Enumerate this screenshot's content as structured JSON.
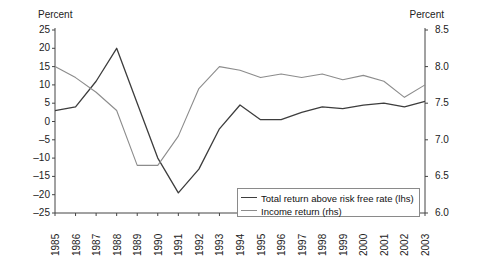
{
  "chart_data": {
    "type": "line",
    "title": "",
    "xlabel": "",
    "ylabel": "Percent",
    "left_axis": {
      "label": "Percent",
      "ticks": [
        "25",
        "20",
        "15",
        "10",
        "5",
        "0",
        "-5",
        "-10",
        "-15",
        "-20",
        "-25"
      ],
      "ylim": [
        -25,
        25
      ],
      "step": 5
    },
    "right_axis": {
      "label": "Percent",
      "ticks": [
        "8.5",
        "8.0",
        "7.5",
        "7.0",
        "6.5",
        "6.0"
      ],
      "ylim": [
        6.0,
        8.5
      ],
      "step": 0.5
    },
    "categories": [
      "1985",
      "1986",
      "1987",
      "1988",
      "1989",
      "1990",
      "1991",
      "1992",
      "1993",
      "1994",
      "1995",
      "1996",
      "1997",
      "1998",
      "1999",
      "2000",
      "2001",
      "2002",
      "2003"
    ],
    "x": [
      1985,
      1986,
      1987,
      1988,
      1989,
      1990,
      1991,
      1992,
      1993,
      1994,
      1995,
      1996,
      1997,
      1998,
      1999,
      2000,
      2001,
      2002,
      2003
    ],
    "series": [
      {
        "name": "Total return above risk free rate (lhs)",
        "axis": "left",
        "color": "#3d3d3d",
        "values": [
          3,
          4,
          11,
          20,
          5,
          -10,
          -19.5,
          -13,
          -2,
          4.5,
          0.5,
          0.5,
          2.5,
          4,
          3.5,
          4.5,
          5,
          4,
          5.5
        ]
      },
      {
        "name": "Income return (rhs)",
        "axis": "right",
        "color": "#8c8c8c",
        "values": [
          8.0,
          7.85,
          7.65,
          7.4,
          6.65,
          6.65,
          7.05,
          7.7,
          8.0,
          7.95,
          7.85,
          7.9,
          7.85,
          7.9,
          7.82,
          7.88,
          7.8,
          7.58,
          7.75
        ]
      }
    ],
    "grid": false,
    "legend_position": "bottom-right"
  },
  "legend": {
    "items": [
      {
        "label": "Total return above risk free rate (lhs)",
        "color": "#3d3d3d"
      },
      {
        "label": "Income return (rhs)",
        "color": "#8c8c8c"
      }
    ]
  }
}
